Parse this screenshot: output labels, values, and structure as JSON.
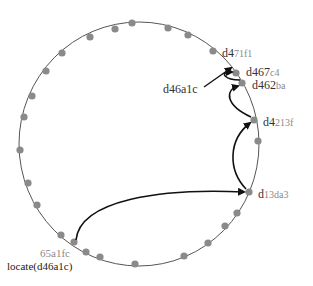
{
  "diagram": {
    "ring": {
      "cx": 139,
      "cy": 144,
      "rx": 120,
      "ry": 122,
      "stroke": "#555555"
    },
    "node_color": "#8a8a8a",
    "arrow_color": "#111111",
    "nodes": [
      {
        "x": 132,
        "y": 23
      },
      {
        "x": 168,
        "y": 28
      },
      {
        "x": 188,
        "y": 35
      },
      {
        "x": 213,
        "y": 51
      },
      {
        "x": 236,
        "y": 73
      },
      {
        "x": 242,
        "y": 83
      },
      {
        "x": 254,
        "y": 120
      },
      {
        "x": 258,
        "y": 141
      },
      {
        "x": 249,
        "y": 192
      },
      {
        "x": 237,
        "y": 213
      },
      {
        "x": 225,
        "y": 226
      },
      {
        "x": 208,
        "y": 243
      },
      {
        "x": 184,
        "y": 256
      },
      {
        "x": 135,
        "y": 264
      },
      {
        "x": 100,
        "y": 257
      },
      {
        "x": 86,
        "y": 252
      },
      {
        "x": 74,
        "y": 242
      },
      {
        "x": 61,
        "y": 235
      },
      {
        "x": 37,
        "y": 205
      },
      {
        "x": 28,
        "y": 183
      },
      {
        "x": 20,
        "y": 150
      },
      {
        "x": 24,
        "y": 117
      },
      {
        "x": 32,
        "y": 96
      },
      {
        "x": 46,
        "y": 71
      },
      {
        "x": 62,
        "y": 53
      },
      {
        "x": 90,
        "y": 37
      },
      {
        "x": 115,
        "y": 29
      }
    ],
    "labels": {
      "d471f1": {
        "prefix": "d4",
        "suffix": "71f1"
      },
      "d467c4": {
        "prefix": "d467",
        "suffix": "c4"
      },
      "d462ba": {
        "prefix": "d462",
        "suffix": "ba"
      },
      "d4213f": {
        "prefix": "d4",
        "suffix": "213f"
      },
      "d13da3": {
        "prefix": "d",
        "suffix": "13da3"
      },
      "target": "d46a1c",
      "origin": "65a1fc",
      "query": "locate(d46a1c)"
    },
    "hops": [
      {
        "from": "65a1fc",
        "to": "d13da3"
      },
      {
        "from": "d13da3",
        "to": "d4213f"
      },
      {
        "from": "d4213f",
        "to": "d462ba"
      },
      {
        "from": "d462ba",
        "to": "d467c4"
      }
    ]
  }
}
